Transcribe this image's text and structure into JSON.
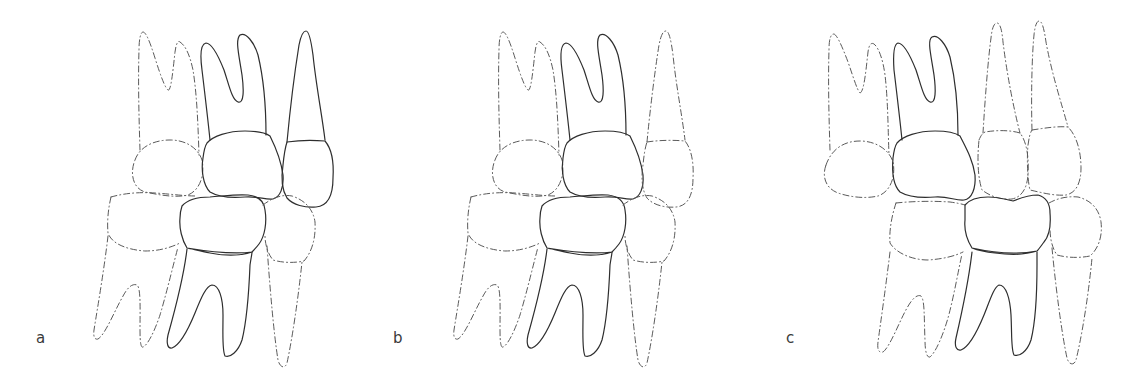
{
  "figure": {
    "panels": [
      {
        "label": "a",
        "label_pos": [
          36,
          331
        ],
        "teeth": [
          {
            "name": "upper-left-molar",
            "style": "dashed",
            "outline": "M140,150 C139,120 138,80 139,50 C139,38 141,32 143,32 C146,32 150,42 155,58 C160,74 165,88 168,90 C171,92 173,70 175,52 C176,44 178,40 180,42 C186,46 190,56 193,70 C197,95 198,125 199,155",
            "crown": "M135,160 C140,146 155,140 170,140 C186,140 198,148 202,160 C205,175 200,190 188,195 C175,198 160,195 145,192 C132,188 130,172 135,160 Z"
          },
          {
            "name": "upper-center-molar",
            "style": "solid",
            "outline": "M210,140 C208,120 205,95 202,70 C200,55 201,44 206,43 C212,43 218,55 224,70 C229,85 232,100 238,102 C244,104 244,90 242,75 C239,55 235,40 240,35 C246,32 254,42 258,55 C264,80 266,110 266,135",
            "crown": "M207,143 C213,136 228,131 245,131 C258,131 266,133 270,136 C276,148 281,160 283,175 C284,188 280,197 273,199 C265,200 258,196 245,197 C232,198 220,198 210,192 C203,185 201,170 203,158 C204,150 205,146 207,143 Z"
          },
          {
            "name": "upper-right-premolar",
            "style": "solid",
            "outline": "M287,142 C290,110 295,70 299,45 C301,35 303,31 306,31 C309,31 311,40 313,55 C316,85 322,115 325,140",
            "crown": "M287,142 C300,140 314,140 325,141 C331,148 334,162 333,178 C333,195 328,206 316,207 C305,208 293,205 287,198 C282,190 281,178 283,165 C284,155 285,148 287,142 Z"
          },
          {
            "name": "lower-left-molar",
            "style": "dashed",
            "outline": "M108,236 C104,270 98,305 94,330 C93,337 95,340 98,339 C105,335 115,310 122,298 C127,288 132,283 137,285 C141,288 140,310 140,330 C140,343 141,348 143,347 C148,345 155,330 160,315 C166,295 172,270 178,247",
            "crown": "M111,197 C125,193 140,192 155,193 C170,194 185,196 196,196 M111,197 C108,210 107,222 108,233 C112,245 130,250 145,251 C160,251 172,247 180,243"
          },
          {
            "name": "lower-center-molar",
            "style": "solid",
            "outline": "M187,249 C184,275 175,310 168,335 C166,344 168,349 172,348 C180,345 188,330 195,313 C201,298 206,286 212,285 C219,285 223,298 223,315 C223,335 222,350 225,356 C230,358 238,352 242,340 C247,320 249,290 250,265 C251,258 252,254 252,252",
            "crown": "M182,206 C188,199 198,197 210,197 C224,196 236,194 248,195 C257,196 264,200 265,210 C267,222 265,236 259,244 C256,248 254,250 252,252 C240,256 225,256 210,253 C200,251 192,249 187,248 C182,240 179,228 180,218 C180,212 181,209 182,206 Z M187,248 C205,251 230,255 252,252"
          },
          {
            "name": "lower-right-premolar",
            "style": "dashed",
            "outline": "M267,246 C270,290 274,335 278,360 C280,368 285,369 287,363 C292,340 298,300 302,262",
            "crown": "M263,205 C272,198 282,194 292,196 C304,200 313,208 315,222 C316,240 311,253 304,261 C295,263 283,263 273,260 C268,254 265,245 265,235"
          }
        ]
      },
      {
        "label": "b",
        "label_pos": [
          393,
          331
        ],
        "offset": 360,
        "teeth": [
          {
            "name": "upper-left-molar",
            "style": "dashed",
            "copy_from_a": 0
          },
          {
            "name": "upper-center-molar",
            "style": "solid",
            "copy_from_a": 1
          },
          {
            "name": "upper-right-premolar",
            "style": "dashed",
            "copy_from_a": 2
          },
          {
            "name": "lower-left-molar",
            "style": "dashed",
            "copy_from_a": 3
          },
          {
            "name": "lower-center-molar",
            "style": "solid",
            "copy_from_a": 4
          },
          {
            "name": "lower-right-premolar",
            "style": "dashed",
            "copy_from_a": 5
          }
        ]
      },
      {
        "label": "c",
        "label_pos": [
          786,
          331
        ],
        "teeth": [
          {
            "name": "upper-left-molar",
            "style": "dashed",
            "outline": "M830,150 C829,120 828,80 829,50 C829,38 831,34 834,34 C837,35 842,46 848,62 C853,76 857,90 860,93 C864,92 866,70 868,52 C869,45 871,42 874,44 C879,48 883,60 885,75 C888,100 888,130 889,155",
            "crown": "M826,165 C832,148 845,141 860,141 C875,141 889,149 893,162 C896,177 890,192 878,196 C865,199 850,197 838,193 C825,188 822,176 826,165 Z"
          },
          {
            "name": "upper-center-molar",
            "style": "solid",
            "outline": "M902,140 C900,120 897,95 894,70 C893,55 894,44 898,43 C904,43 910,55 916,70 C921,85 924,100 930,102 C936,104 936,90 934,75 C931,55 927,40 932,37 C938,34 946,44 950,57 C956,82 958,110 958,135",
            "crown": "M897,143 C903,136 918,131 935,131 C948,131 956,133 960,136 C966,148 973,160 975,175 C976,188 972,199 964,200 C956,201 948,196 935,197 C922,198 910,198 900,192 C893,185 892,170 893,158 C894,150 895,146 897,143 Z"
          },
          {
            "name": "upper-premolar-1",
            "style": "dashed",
            "outline": "M983,133 C985,100 988,60 991,38 C992,28 994,23 997,23 C1000,23 1002,30 1003,42 C1007,75 1014,110 1020,133",
            "crown": "M979,140 C981,135 983,133 985,132 C997,130 1010,130 1020,133 C1027,142 1029,158 1028,175 C1027,188 1022,197 1012,199 C1000,200 990,196 982,190 C978,178 977,160 979,140 Z"
          },
          {
            "name": "upper-premolar-2",
            "style": "dashed",
            "outline": "M1032,130 C1031,95 1032,55 1034,35 C1035,25 1037,21 1039,21 C1042,21 1044,28 1046,42 C1052,75 1062,105 1068,127",
            "crown": "M1032,130 C1045,128 1058,126 1068,127 C1076,135 1081,150 1081,168 C1081,183 1076,193 1066,195 C1055,196 1043,193 1030,190 C1027,178 1027,155 1028,145 C1029,138 1030,133 1032,130 Z"
          },
          {
            "name": "lower-left-molar",
            "style": "dashed",
            "outline": "M890,252 C886,285 881,320 878,342 C877,350 879,353 883,352 C890,347 900,320 907,308 C912,299 917,294 921,296 C925,300 924,320 925,340 C925,352 927,358 930,357 C936,352 943,335 948,318 C954,296 958,272 962,254",
            "crown": "M896,203 C915,201 935,201 950,202 C957,203 962,204 965,205 M896,203 C892,215 889,230 890,243 C896,253 912,260 928,260 C943,259 955,256 963,252"
          },
          {
            "name": "lower-center-molar",
            "style": "solid",
            "outline": "M972,252 C969,278 962,312 956,338 C954,347 957,351 961,350 C969,347 977,332 984,315 C990,300 994,287 999,285 C1006,285 1010,298 1011,315 C1012,335 1011,350 1014,355 C1019,357 1027,352 1031,340 C1036,320 1037,290 1037,265 C1037,258 1037,254 1037,252",
            "crown": "M965,205 C970,199 978,197 988,197 C998,197 1005,199 1013,201 C1020,198 1030,195 1038,195 C1045,197 1050,203 1050,213 C1051,225 1049,236 1044,242 C1041,246 1039,249 1037,251 C1025,255 1010,255 995,253 C985,252 977,250 972,248 C967,240 964,230 965,220 C965,213 965,209 965,205 Z M972,248 C990,252 1015,255 1037,251"
          },
          {
            "name": "lower-right-premolar",
            "style": "dashed",
            "outline": "M1052,248 C1056,290 1062,335 1067,358 C1069,365 1074,366 1076,360 C1081,340 1088,300 1092,258",
            "crown": "M1049,203 C1058,198 1068,196 1078,197 C1090,200 1099,208 1101,222 C1103,238 1097,250 1090,256 C1080,258 1068,258 1057,255 C1052,248 1050,238 1050,228"
          }
        ]
      }
    ]
  }
}
